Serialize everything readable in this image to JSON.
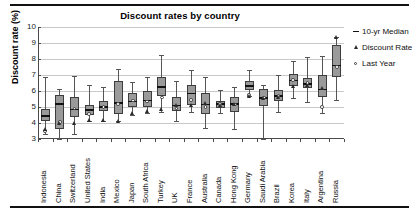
{
  "chart_data": {
    "type": "box",
    "title": "Discount rates by country",
    "xlabel": "",
    "ylabel": "Discount rate (%)",
    "ylim": [
      3,
      10
    ],
    "yticks": [
      3,
      4,
      5,
      6,
      7,
      8,
      9,
      10
    ],
    "grid": true,
    "legend_position": "right",
    "legend": [
      {
        "label": "10-yr Median",
        "marker": "dash"
      },
      {
        "label": "Discount Rate",
        "marker": "triangle"
      },
      {
        "label": "Last Year",
        "marker": "circle"
      }
    ],
    "categories": [
      "Indonesia",
      "China",
      "Switzerland",
      "United States",
      "India",
      "Mexico",
      "Japan",
      "South Africa",
      "Turkey",
      "UK",
      "France",
      "Australia",
      "Canada",
      "Hong Kong",
      "Germany",
      "Saudi Arabia",
      "Brazil",
      "Korea",
      "Italy",
      "Argentina",
      "Russia"
    ],
    "series": [
      {
        "name": "Indonesia",
        "min": 3.3,
        "q1": 4.1,
        "median": 4.45,
        "q3": 4.9,
        "max": 6.9,
        "discount_rate": 3.6,
        "last_year": 3.5
      },
      {
        "name": "China",
        "min": 3.0,
        "q1": 3.6,
        "median": 5.2,
        "q3": 5.75,
        "max": 6.15,
        "discount_rate": 4.0,
        "last_year": 4.05
      },
      {
        "name": "Switzerland",
        "min": 3.3,
        "q1": 4.35,
        "median": 4.85,
        "q3": 5.65,
        "max": 6.95,
        "discount_rate": 4.0,
        "last_year": 4.9
      },
      {
        "name": "United States",
        "min": 4.1,
        "q1": 4.5,
        "median": 4.8,
        "q3": 5.15,
        "max": 6.4,
        "discount_rate": 4.2,
        "last_year": 4.55
      },
      {
        "name": "India",
        "min": 4.1,
        "q1": 4.75,
        "median": 5.0,
        "q3": 5.35,
        "max": 6.25,
        "discount_rate": 4.2,
        "last_year": 5.0
      },
      {
        "name": "Mexico",
        "min": 4.1,
        "q1": 4.55,
        "median": 5.25,
        "q3": 6.6,
        "max": 7.4,
        "discount_rate": 4.15,
        "last_year": 5.2
      },
      {
        "name": "Japan",
        "min": 4.5,
        "q1": 5.0,
        "median": 5.35,
        "q3": 5.9,
        "max": 6.55,
        "discount_rate": 4.65,
        "last_year": 5.4
      },
      {
        "name": "South Africa",
        "min": 4.65,
        "q1": 5.0,
        "median": 5.4,
        "q3": 6.0,
        "max": 6.85,
        "discount_rate": 4.75,
        "last_year": 5.35
      },
      {
        "name": "Turkey",
        "min": 4.7,
        "q1": 5.7,
        "median": 6.25,
        "q3": 6.9,
        "max": 8.25,
        "discount_rate": 4.9,
        "last_year": 5.6
      },
      {
        "name": "UK",
        "min": 4.1,
        "q1": 4.75,
        "median": 5.1,
        "q3": 5.6,
        "max": 6.6,
        "discount_rate": 5.15,
        "last_year": 4.9
      },
      {
        "name": "France",
        "min": 4.7,
        "q1": 5.15,
        "median": 5.85,
        "q3": 6.4,
        "max": 7.3,
        "discount_rate": 5.1,
        "last_year": 5.45
      },
      {
        "name": "Australia",
        "min": 3.7,
        "q1": 4.55,
        "median": 5.15,
        "q3": 5.85,
        "max": 6.85,
        "discount_rate": 5.25,
        "last_year": 5.0
      },
      {
        "name": "Canada",
        "min": 4.65,
        "q1": 4.95,
        "median": 5.2,
        "q3": 5.4,
        "max": 6.05,
        "discount_rate": 5.15,
        "last_year": 5.2
      },
      {
        "name": "Hong Kong",
        "min": 3.6,
        "q1": 4.7,
        "median": 5.2,
        "q3": 5.6,
        "max": 6.25,
        "discount_rate": 5.2,
        "last_year": 5.15
      },
      {
        "name": "Germany",
        "min": 5.7,
        "q1": 6.05,
        "median": 6.3,
        "q3": 6.6,
        "max": 7.3,
        "discount_rate": 5.7,
        "last_year": 5.75
      },
      {
        "name": "Saudi Arabia",
        "min": 3.0,
        "q1": 5.05,
        "median": 5.55,
        "q3": 6.1,
        "max": 6.4,
        "discount_rate": 5.55,
        "last_year": 5.6
      },
      {
        "name": "Brazil",
        "min": 4.7,
        "q1": 5.35,
        "median": 5.7,
        "q3": 6.05,
        "max": 7.0,
        "discount_rate": 5.6,
        "last_year": 5.7
      },
      {
        "name": "Korea",
        "min": 5.55,
        "q1": 6.3,
        "median": 6.65,
        "q3": 7.05,
        "max": 7.9,
        "discount_rate": 6.3,
        "last_year": 6.7
      },
      {
        "name": "Italy",
        "min": 5.3,
        "q1": 6.2,
        "median": 6.45,
        "q3": 6.8,
        "max": 8.1,
        "discount_rate": 6.35,
        "last_year": 6.5
      },
      {
        "name": "Argentina",
        "min": 4.65,
        "q1": 5.65,
        "median": 6.1,
        "q3": 7.0,
        "max": 8.2,
        "discount_rate": 6.2,
        "last_year": 5.0
      },
      {
        "name": "Russia",
        "min": 5.45,
        "q1": 6.9,
        "median": 7.6,
        "q3": 8.9,
        "max": 9.4,
        "discount_rate": 9.35,
        "last_year": 7.5
      }
    ]
  }
}
